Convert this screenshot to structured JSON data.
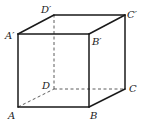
{
  "diagram": {
    "type": "cube",
    "title": "",
    "vertices": {
      "A": {
        "label": "A",
        "x": 18,
        "y": 107
      },
      "B": {
        "label": "B",
        "x": 89,
        "y": 107
      },
      "C": {
        "label": "C",
        "x": 125,
        "y": 89
      },
      "D": {
        "label": "D",
        "x": 54,
        "y": 89
      },
      "A1": {
        "label": "A′",
        "x": 18,
        "y": 34
      },
      "B1": {
        "label": "B′",
        "x": 89,
        "y": 34
      },
      "C1": {
        "label": "C′",
        "x": 125,
        "y": 15
      },
      "D1": {
        "label": "D′",
        "x": 54,
        "y": 15
      }
    },
    "visible_edges": [
      "AB",
      "BC",
      "A1B1",
      "B1C1",
      "C1D1",
      "D1A1",
      "AA1",
      "BB1",
      "CC1"
    ],
    "hidden_edges": [
      "AD",
      "DC",
      "DD1"
    ]
  }
}
